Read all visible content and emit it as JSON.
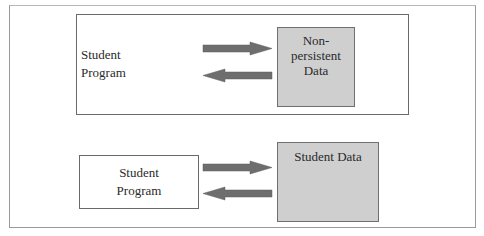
{
  "diagram": {
    "top_panel": {
      "program_label_line1": "Student",
      "program_label_line2": "Program",
      "data_label_line1": "Non-persistent",
      "data_label_line2": "Data"
    },
    "bottom_panel": {
      "program_label_line1": "Student",
      "program_label_line2": "Program",
      "data_label": "Student Data"
    },
    "colors": {
      "arrow": "#6e6e6e",
      "data_box_fill": "#cfcfcf",
      "border": "#6a6a6a"
    }
  }
}
